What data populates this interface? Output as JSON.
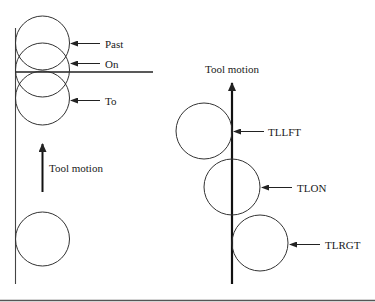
{
  "diagram": {
    "left_panel": {
      "labels": {
        "past": "Past",
        "on": "On",
        "to": "To",
        "tool_motion": "Tool motion"
      }
    },
    "right_panel": {
      "labels": {
        "tool_motion": "Tool motion",
        "tllft": "TLLFT",
        "tlon": "TLON",
        "tlrgt": "TLRGT"
      }
    },
    "colors": {
      "line": "#222222",
      "circle": "#333333",
      "background": "#ffffff",
      "bottom_rule": "#555555"
    }
  }
}
